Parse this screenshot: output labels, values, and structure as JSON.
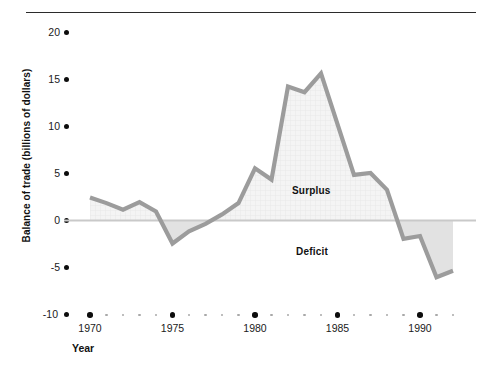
{
  "chart_data": {
    "type": "area",
    "title": "",
    "xlabel": "Year",
    "ylabel": "Balance of trade (billions of dollars)",
    "xlim": [
      1970,
      1992
    ],
    "ylim": [
      -10,
      20
    ],
    "grid": false,
    "legend_position": "none",
    "x_major_ticks": [
      "1970",
      "1975",
      "1980",
      "1985",
      "1990"
    ],
    "x_major_values": [
      1970,
      1975,
      1980,
      1985,
      1990
    ],
    "x_minor_values": [
      1971,
      1972,
      1973,
      1974,
      1976,
      1977,
      1978,
      1979,
      1981,
      1982,
      1983,
      1984,
      1986,
      1987,
      1988,
      1989,
      1991,
      1992
    ],
    "y_ticks": [
      "20",
      "15",
      "10",
      "5",
      "0",
      "-5",
      "-10"
    ],
    "y_tick_values": [
      20,
      15,
      10,
      5,
      0,
      -5,
      -10
    ],
    "zero_line_value": 0,
    "annotations": [
      {
        "name": "surplus-label",
        "text": "Surplus",
        "x": 1983.2,
        "y": 3.1
      },
      {
        "name": "deficit-label",
        "text": "Deficit",
        "x": 1983.2,
        "y": -3.0
      }
    ],
    "x": [
      1970,
      1971,
      1972,
      1973,
      1974,
      1975,
      1976,
      1977,
      1978,
      1979,
      1980,
      1981,
      1982,
      1983,
      1984,
      1985,
      1986,
      1987,
      1988,
      1989,
      1990,
      1991,
      1992
    ],
    "values": [
      2.4,
      1.8,
      1.1,
      1.9,
      0.9,
      -2.5,
      -1.2,
      -0.4,
      0.6,
      1.8,
      5.5,
      4.3,
      14.2,
      13.6,
      15.6,
      10.2,
      4.8,
      5.0,
      3.2,
      -2.0,
      -1.7,
      -6.1,
      -5.4
    ],
    "series": [
      {
        "name": "Balance of trade",
        "values": [
          2.4,
          1.8,
          1.1,
          1.9,
          0.9,
          -2.5,
          -1.2,
          -0.4,
          0.6,
          1.8,
          5.5,
          4.3,
          14.2,
          13.6,
          15.6,
          10.2,
          4.8,
          5.0,
          3.2,
          -2.0,
          -1.7,
          -6.1,
          -5.4
        ]
      }
    ],
    "colors": {
      "line": "#9a9a9a",
      "surplus_fill": "#f2f2f2",
      "deficit_fill": "#e0e0e0",
      "zero_line": "#c9c9c9",
      "tick_dot": "#0d0d0d",
      "minor_tick_dot": "#a8a8a8",
      "top_rule": "#2b2b2b",
      "text": "#111111"
    }
  }
}
